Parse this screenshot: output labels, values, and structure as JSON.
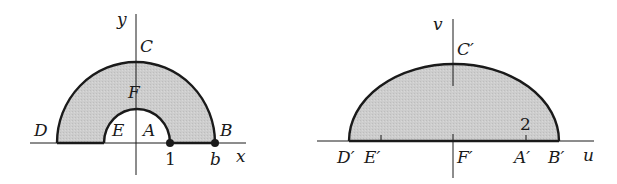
{
  "colors": {
    "background": "#ffffff",
    "ink": "#1a1a1a",
    "region_fill": "#c8c8c8"
  },
  "left_diagram": {
    "axes": {
      "horizontal": "x",
      "vertical": "y"
    },
    "points": {
      "A": "A",
      "B": "B",
      "C": "C",
      "D": "D",
      "E": "E",
      "F": "F"
    },
    "tick_labels": {
      "one": "1",
      "b": "b"
    },
    "description": "Half-annulus region between radius 1 and radius b in the upper half-plane"
  },
  "right_diagram": {
    "axes": {
      "horizontal": "u",
      "vertical": "v"
    },
    "points": {
      "A": "A′",
      "B": "B′",
      "C": "C′",
      "D": "D′",
      "E": "E′",
      "F": "F′"
    },
    "tick_labels": {
      "two": "2"
    },
    "description": "Upper half of an ellipse region (image of half-annulus)"
  }
}
